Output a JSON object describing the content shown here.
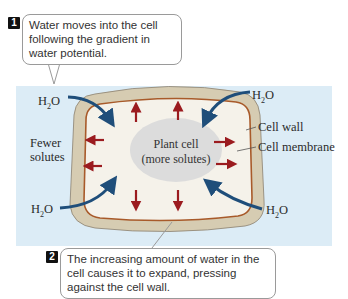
{
  "callouts": [
    {
      "number": "1",
      "text": "Water moves into the cell following the gradient in water potential."
    },
    {
      "number": "2",
      "text": "The increasing amount of water in the cell causes it to expand, pressing against the cell wall."
    }
  ],
  "labels": {
    "h2o_prefix": "H",
    "h2o_sub": "2",
    "h2o_suffix": "O",
    "cell_wall": "Cell wall",
    "cell_membrane": "Cell membrane",
    "fewer_solutes_line1": "Fewer",
    "fewer_solutes_line2": "solutes",
    "center_line1": "Plant cell",
    "center_line2": "(more solutes)"
  },
  "colors": {
    "background_panel": "#dcecf6",
    "cell_wall": "#d6ccb2",
    "cell_membrane": "#a85a2a",
    "cytoplasm": "#f5f2ea",
    "vacuole": "#dcdcdc",
    "water_arrow": "#1f4e7a",
    "pressure_arrow": "#9b1b1f"
  }
}
